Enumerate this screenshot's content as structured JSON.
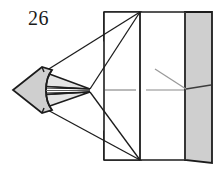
{
  "figure": {
    "label": "26",
    "caption": "",
    "colors": {
      "outline": "#1c1c1c",
      "fill_gray": "#cfcfcf",
      "fill_gray_dark": "#c2c2c2",
      "fill_white": "#ffffff",
      "centerline": "#8a8a8a",
      "leader_line": "#9a9a9a",
      "background": "#ffffff"
    },
    "geometry": {
      "cone_tip": [
        13,
        90
      ],
      "body_left_edge_x": 104,
      "body_mid_edge_x": 140,
      "body_band_left_x": 183,
      "body_band_right_x": 212,
      "body_top_y": 12,
      "body_bottom_y": 160,
      "apex_point": [
        90,
        90
      ],
      "top_corner": [
        140,
        12
      ],
      "bottom_corner": [
        140,
        160
      ]
    },
    "parts": {
      "cone_label": "tapered nose cone",
      "wings_label": "projection wings",
      "cylinder_label": "cylindrical body",
      "band_label": "right end band",
      "axis_label": "center axis line",
      "leader_label": "leader line"
    }
  }
}
